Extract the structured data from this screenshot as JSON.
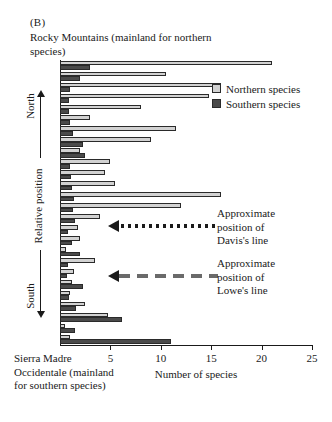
{
  "figure": {
    "panel_letter": "(B)",
    "top_caption": "Rocky Mountains (mainland for northern species)",
    "bottom_caption": "Sierra Madre Occidentale (mainland for southern species)"
  },
  "legend": {
    "position": "top-right",
    "items": [
      {
        "label": "Northern species",
        "color": "#d2d2d2"
      },
      {
        "label": "Southern species",
        "color": "#4a4a4a"
      }
    ]
  },
  "annotations": [
    {
      "name": "davis-line",
      "text": "Approximate\nposition of\nDavis's line",
      "arrow_style": "dotted"
    },
    {
      "name": "lowe-line",
      "text": "Approximate\nposition of\nLowe's line",
      "arrow_style": "dashed"
    }
  ],
  "axes": {
    "y_title": "Relative position",
    "y_direction_top": "North",
    "y_direction_bottom": "South",
    "x_title": "Number of species",
    "x_ticks": [
      5,
      10,
      15,
      20,
      25
    ],
    "x_tick_labels": [
      "5",
      "10",
      "15",
      "20",
      "25"
    ],
    "xlim": [
      0,
      25
    ]
  },
  "chart_data": {
    "type": "bar",
    "orientation": "horizontal",
    "title": "Rocky Mountains (mainland for northern species)",
    "xlabel": "Number of species",
    "ylabel": "Relative position",
    "xlim": [
      0,
      25
    ],
    "grid": false,
    "legend_position": "top-right",
    "categories": [
      "site-1",
      "site-2",
      "site-3",
      "site-4",
      "site-5",
      "site-6",
      "site-7",
      "site-8",
      "site-9",
      "site-10",
      "site-11",
      "site-12",
      "site-13",
      "site-14",
      "site-15",
      "site-16",
      "site-17",
      "site-18",
      "site-19",
      "site-20",
      "site-21",
      "site-22",
      "site-23",
      "site-24",
      "site-25",
      "site-26"
    ],
    "series": [
      {
        "name": "Northern species",
        "color": "#d2d2d2",
        "values": [
          21.0,
          10.5,
          16.0,
          14.8,
          8.0,
          3.0,
          11.5,
          9.0,
          2.0,
          5.0,
          4.5,
          5.5,
          16.0,
          12.0,
          4.0,
          1.8,
          2.0,
          0.6,
          3.5,
          1.4,
          1.2,
          1.0,
          2.5,
          4.8,
          0.5,
          1.0
        ]
      },
      {
        "name": "Southern species",
        "color": "#4a4a4a",
        "values": [
          3.0,
          2.0,
          1.0,
          0.9,
          0.9,
          1.0,
          1.3,
          2.3,
          2.5,
          1.0,
          1.1,
          1.2,
          1.4,
          1.3,
          1.5,
          0.8,
          1.2,
          2.0,
          0.8,
          0.7,
          2.3,
          0.9,
          1.6,
          6.2,
          1.5,
          11.0
        ]
      }
    ]
  }
}
